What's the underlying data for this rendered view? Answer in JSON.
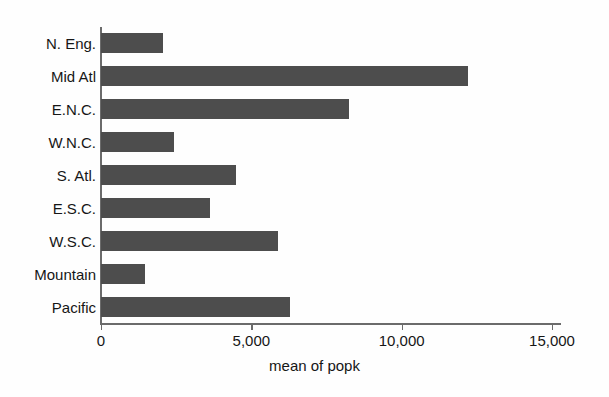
{
  "chart_data": {
    "type": "bar",
    "orientation": "horizontal",
    "title": "",
    "xlabel": "mean of popk",
    "ylabel": "",
    "categories": [
      "N. Eng.",
      "Mid Atl",
      "E.N.C.",
      "W.N.C.",
      "S. Atl.",
      "E.S.C.",
      "W.S.C.",
      "Mountain",
      "Pacific"
    ],
    "values": [
      2050,
      12200,
      8250,
      2430,
      4490,
      3630,
      5890,
      1460,
      6290
    ],
    "xlim": [
      0,
      15000
    ],
    "xticks": [
      0,
      5000,
      10000,
      15000
    ],
    "xticklabels": [
      "0",
      "5,000",
      "10,000",
      "15,000"
    ],
    "grid": false,
    "legend": null,
    "bar_color": "#4d4d4d",
    "axis_color": "#6b6b6b",
    "background_color": "#fefefe"
  }
}
